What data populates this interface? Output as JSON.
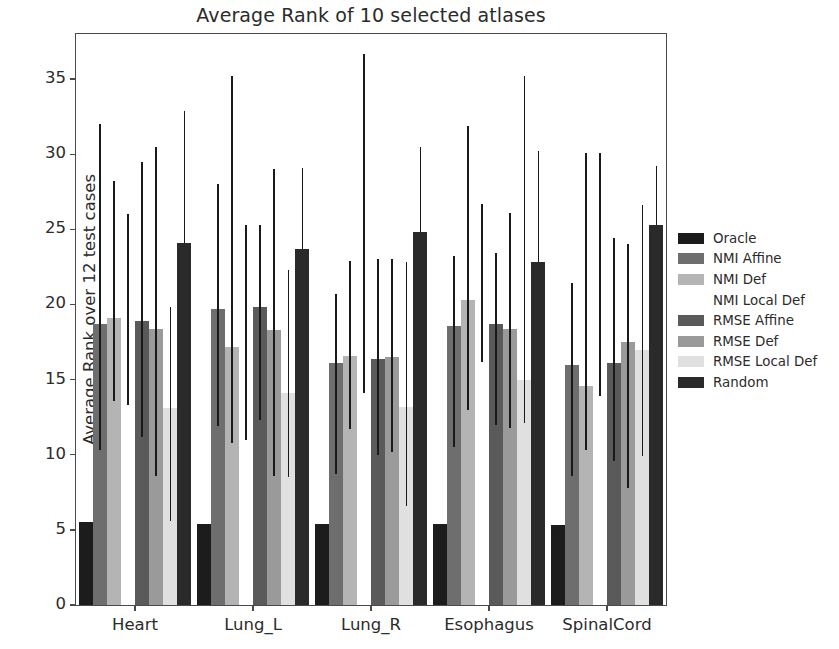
{
  "chart_data": {
    "type": "bar",
    "title": "Average Rank of 10 selected atlases",
    "xlabel": "",
    "ylabel": "Average Rank over 12 test cases",
    "categories": [
      "Heart",
      "Lung_L",
      "Lung_R",
      "Esophagus",
      "SpinalCord"
    ],
    "ylim": [
      0,
      38
    ],
    "yticks": [
      0,
      5,
      10,
      15,
      20,
      25,
      30,
      35
    ],
    "grid": false,
    "legend_position": "right",
    "error_bars": "vertical lines extending above and below bar tops",
    "series": [
      {
        "name": "Oracle",
        "color": "#1c1c1c",
        "values": [
          5.5,
          5.4,
          5.4,
          5.4,
          5.3
        ],
        "err_low": [
          5.5,
          5.4,
          5.4,
          5.4,
          4.6
        ],
        "err_high": [
          5.5,
          5.4,
          5.4,
          5.4,
          5.3
        ]
      },
      {
        "name": "NMI Affine",
        "color": "#6e6e6e",
        "values": [
          18.7,
          19.7,
          16.1,
          18.6,
          16.0
        ],
        "err_low": [
          10.3,
          11.9,
          8.7,
          10.5,
          8.6
        ],
        "err_high": [
          32.0,
          28.0,
          20.7,
          23.2,
          21.4
        ]
      },
      {
        "name": "NMI Def",
        "color": "#b4b4b4",
        "values": [
          19.1,
          17.2,
          16.6,
          20.3,
          14.6
        ],
        "err_low": [
          13.6,
          10.8,
          11.7,
          13.0,
          10.3
        ],
        "err_high": [
          28.2,
          35.2,
          22.9,
          31.9,
          30.1
        ]
      },
      {
        "name": "NMI Local Def",
        "color": "#ffffff",
        "values": [
          13.3,
          11.0,
          14.1,
          16.2,
          13.9
        ],
        "err_low": [
          13.3,
          11.0,
          14.1,
          16.2,
          13.9
        ],
        "err_high": [
          26.0,
          25.3,
          36.7,
          26.7,
          30.1
        ]
      },
      {
        "name": "RMSE Affine",
        "color": "#5a5a5a",
        "values": [
          18.9,
          19.8,
          16.4,
          18.7,
          16.1
        ],
        "err_low": [
          11.2,
          12.3,
          10.0,
          12.0,
          9.6
        ],
        "err_high": [
          29.5,
          25.3,
          23.0,
          23.4,
          24.4
        ]
      },
      {
        "name": "RMSE Def",
        "color": "#9a9a9a",
        "values": [
          18.4,
          18.3,
          16.5,
          18.4,
          17.5
        ],
        "err_low": [
          8.6,
          8.6,
          10.2,
          11.8,
          7.8
        ],
        "err_high": [
          30.5,
          29.0,
          23.0,
          26.1,
          24.0
        ]
      },
      {
        "name": "RMSE Local Def",
        "color": "#e0e0e0",
        "values": [
          13.1,
          14.1,
          13.2,
          15.0,
          17.0
        ],
        "err_low": [
          5.6,
          8.5,
          6.6,
          12.1,
          9.9
        ],
        "err_high": [
          19.8,
          22.3,
          22.8,
          35.2,
          26.6
        ]
      },
      {
        "name": "Random",
        "color": "#2a2a2a",
        "values": [
          24.1,
          23.7,
          24.8,
          22.8,
          25.3
        ],
        "err_low": [
          24.1,
          23.7,
          24.8,
          22.8,
          25.3
        ],
        "err_high": [
          32.9,
          29.1,
          30.5,
          30.2,
          29.2
        ]
      }
    ]
  }
}
